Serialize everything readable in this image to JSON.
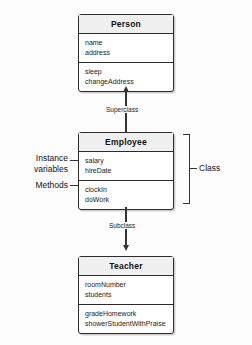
{
  "diagram": {
    "classes": [
      {
        "name": "Person",
        "attributes": [
          "name",
          "address"
        ],
        "methods": [
          "sleep",
          "changeAddress"
        ]
      },
      {
        "name": "Employee",
        "attributes": [
          "salary",
          "hireDate"
        ],
        "methods": [
          "clockIn",
          "doWork"
        ]
      },
      {
        "name": "Teacher",
        "attributes": [
          "roomNumber",
          "students"
        ],
        "methods": [
          "gradeHomework",
          "showerStudentWithPraise"
        ]
      }
    ],
    "connector_labels": {
      "superclass": "Superclass",
      "subclass": "Subclass"
    },
    "annotations": {
      "instance_variables_line1": "Instance",
      "instance_variables_line2": "variables",
      "methods": "Methods",
      "class": "Class"
    },
    "colors": {
      "background": "#fdfdfd",
      "box_fill": "#ffffff",
      "header_fill": "#f0f0f0",
      "stroke": "#2b2b2b",
      "text": "#111111"
    }
  }
}
